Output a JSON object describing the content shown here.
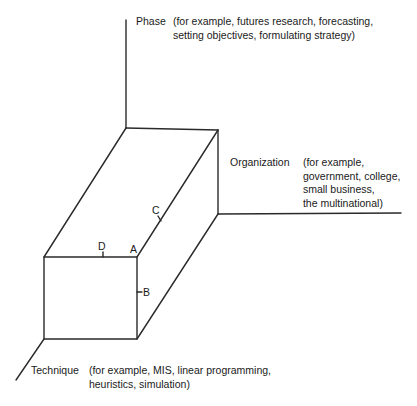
{
  "diagram": {
    "type": "three-dimensional axis diagram (cube)",
    "axes": {
      "phase": {
        "name": "Phase",
        "examples_lines": [
          "(for example, futures research, forecasting,",
          "setting objectives, formulating strategy)"
        ]
      },
      "organization": {
        "name": "Organization",
        "examples_lines": [
          "(for example,",
          "government, college,",
          "small business,",
          "the multinational)"
        ]
      },
      "technique": {
        "name": "Technique",
        "examples_lines": [
          "(for example, MIS, linear programming,",
          "heuristics, simulation)"
        ]
      }
    },
    "points": [
      {
        "label": "A"
      },
      {
        "label": "B"
      },
      {
        "label": "C"
      },
      {
        "label": "D"
      }
    ],
    "line_color": "#2a2a2a",
    "background_color": "#ffffff"
  }
}
